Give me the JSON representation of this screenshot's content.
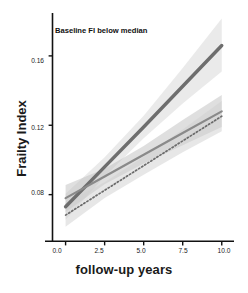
{
  "figure": {
    "annotation": "Baseline FI below median",
    "xlabel": "follow-up years",
    "ylabel": "Frailty Index"
  },
  "axes": {
    "x_ticks": [
      "0.0",
      "2.5",
      "5.0",
      "7.5",
      "10.0"
    ],
    "y_ticks": [
      "0.16",
      "0.12",
      "0.08"
    ]
  },
  "chart_data": {
    "type": "line",
    "title": "Baseline FI below median",
    "xlabel": "follow-up years",
    "ylabel": "Frailty Index",
    "xlim": [
      -0.55,
      10.4
    ],
    "ylim": [
      0.055,
      0.183
    ],
    "xticks": [
      0.0,
      2.5,
      5.0,
      7.5,
      10.0
    ],
    "yticks": [
      0.08,
      0.12,
      0.16
    ],
    "grid": false,
    "legend": "none",
    "annotations": [
      {
        "text": "Baseline FI below median",
        "x": 0.35,
        "y": 0.176
      }
    ],
    "x": [
      0,
      2.5,
      5,
      7.5,
      10
    ],
    "series": [
      {
        "name": "steep-trajectory",
        "style": "solid",
        "color": "#6e6e6e",
        "linewidth": 3.4,
        "values": [
          0.073,
          0.096,
          0.119,
          0.1425,
          0.166
        ],
        "band_lower": [
          0.0655,
          0.0905,
          0.1125,
          0.1325,
          0.151
        ],
        "band_upper": [
          0.0805,
          0.1015,
          0.1255,
          0.153,
          0.1815
        ],
        "band_color": "#d9d9d9",
        "band_opacity": 0.55
      },
      {
        "name": "middle-trajectory",
        "style": "solid",
        "color": "#8a8a8a",
        "linewidth": 2.2,
        "values": [
          0.078,
          0.0905,
          0.103,
          0.1155,
          0.128
        ],
        "band_lower": [
          0.07,
          0.086,
          0.098,
          0.1085,
          0.119
        ],
        "band_upper": [
          0.0855,
          0.095,
          0.108,
          0.123,
          0.1375
        ],
        "band_color": "#bfbfbf",
        "band_opacity": 0.5
      },
      {
        "name": "dotted-trajectory",
        "style": "dotted",
        "color": "#6b6b6b",
        "linewidth": 1.7,
        "values": [
          0.0682,
          0.0825,
          0.0967,
          0.111,
          0.1252
        ],
        "band_lower": [
          0.0615,
          0.078,
          0.0915,
          0.1045,
          0.1165
        ],
        "band_upper": [
          0.075,
          0.0872,
          0.1018,
          0.1175,
          0.134
        ],
        "band_color": "#cfcfcf",
        "band_opacity": 0.5
      }
    ]
  }
}
